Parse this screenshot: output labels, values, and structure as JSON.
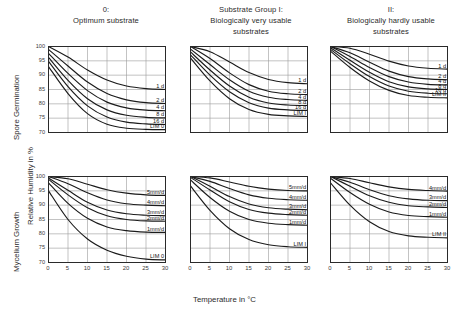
{
  "figure": {
    "axis": {
      "x_label": "Temperature in °C",
      "y_label": "Relative Humidity in %",
      "x_ticks": [
        "0",
        "5",
        "10",
        "15",
        "20",
        "25",
        "30"
      ],
      "y_ticks": [
        "100",
        "95",
        "90",
        "85",
        "80",
        "75",
        "70"
      ],
      "xlim": [
        0,
        30
      ],
      "ylim": [
        70,
        100
      ]
    },
    "row_labels": {
      "top": "Spore Germination",
      "bottom": "Mycelium Growth"
    },
    "column_titles": [
      {
        "line1": "0:",
        "line2": "Optimum substrate",
        "line3": ""
      },
      {
        "line1": "Substrate Group I:",
        "line2": "Biologically very usable",
        "line3": "substrates"
      },
      {
        "line1": "II:",
        "line2": "Biologically hardly usable",
        "line3": "substrates"
      }
    ]
  },
  "chart_data": [
    {
      "type": "line",
      "title": "0: Optimum substrate — Spore Germination",
      "panel": "top-left",
      "xlabel": "Temperature in °C",
      "ylabel": "Relative Humidity in %",
      "xlim": [
        0,
        30
      ],
      "ylim": [
        70,
        100
      ],
      "grid": true,
      "x": [
        0,
        5,
        10,
        15,
        20,
        25,
        30
      ],
      "series": [
        {
          "name": "1 d",
          "label": "1 d",
          "values": [
            100.0,
            96.3,
            91.8,
            88.3,
            86.2,
            85.3,
            85.0
          ]
        },
        {
          "name": "2 d",
          "label": "2 d",
          "values": [
            99.0,
            93.2,
            87.6,
            83.6,
            81.4,
            80.4,
            80.1
          ]
        },
        {
          "name": "4 d",
          "label": "4 d",
          "values": [
            97.6,
            90.6,
            84.6,
            80.6,
            78.6,
            77.8,
            77.6
          ]
        },
        {
          "name": "8 d",
          "label": "8 d",
          "values": [
            96.2,
            88.2,
            81.8,
            77.9,
            76.0,
            75.3,
            75.1
          ]
        },
        {
          "name": "16 d",
          "label": "16 d",
          "values": [
            94.8,
            86.0,
            79.3,
            75.4,
            73.6,
            73.0,
            72.8
          ]
        },
        {
          "name": "LIM 0",
          "label": "LIM 0",
          "values": [
            93.0,
            83.6,
            76.6,
            72.9,
            71.5,
            71.1,
            71.0
          ]
        }
      ]
    },
    {
      "type": "line",
      "title": "Substrate Group I: Biologically very usable substrates — Spore Germination",
      "panel": "top-center",
      "xlabel": "Temperature in °C",
      "ylabel": "Relative Humidity in %",
      "xlim": [
        0,
        30
      ],
      "ylim": [
        70,
        100
      ],
      "grid": true,
      "x": [
        0,
        5,
        10,
        15,
        20,
        25,
        30
      ],
      "series": [
        {
          "name": "1 d",
          "label": "1 d",
          "values": [
            100.0,
            98.2,
            94.6,
            90.9,
            88.5,
            87.4,
            87.0
          ]
        },
        {
          "name": "2 d",
          "label": "2 d",
          "values": [
            100.0,
            95.8,
            90.8,
            86.7,
            84.4,
            83.5,
            83.2
          ]
        },
        {
          "name": "4 d",
          "label": "4 d",
          "values": [
            99.1,
            93.7,
            88.4,
            84.4,
            82.3,
            81.5,
            81.2
          ]
        },
        {
          "name": "8 d",
          "label": "8 d",
          "values": [
            98.1,
            91.8,
            86.2,
            82.3,
            80.3,
            79.6,
            79.4
          ]
        },
        {
          "name": "16 d",
          "label": "16 d",
          "values": [
            97.1,
            90.0,
            84.2,
            80.4,
            78.5,
            77.9,
            77.7
          ]
        },
        {
          "name": "LIM I",
          "label": "LIM I",
          "values": [
            96.0,
            88.0,
            81.8,
            78.0,
            76.3,
            75.8,
            75.6
          ]
        }
      ]
    },
    {
      "type": "line",
      "title": "II: Biologically hardly usable substrates — Spore Germination",
      "panel": "top-right",
      "xlabel": "Temperature in °C",
      "ylabel": "Relative Humidity in %",
      "xlim": [
        0,
        30
      ],
      "ylim": [
        70,
        100
      ],
      "grid": true,
      "x": [
        0,
        5,
        10,
        15,
        20,
        25,
        30
      ],
      "series": [
        {
          "name": "1 d",
          "label": "1 d",
          "values": [
            100.0,
            99.4,
            97.3,
            94.9,
            93.2,
            92.4,
            92.1
          ]
        },
        {
          "name": "2 d",
          "label": "2 d",
          "values": [
            100.0,
            97.8,
            94.5,
            91.4,
            89.5,
            88.7,
            88.4
          ]
        },
        {
          "name": "4 d",
          "label": "4 d",
          "values": [
            100.0,
            96.5,
            92.7,
            89.5,
            87.6,
            86.8,
            86.6
          ]
        },
        {
          "name": "8 d",
          "label": "8 d",
          "values": [
            99.6,
            95.2,
            91.0,
            87.7,
            85.9,
            85.2,
            85.0
          ]
        },
        {
          "name": "16 d",
          "label": "16 d",
          "values": [
            99.0,
            94.0,
            89.5,
            86.2,
            84.4,
            83.7,
            83.5
          ]
        },
        {
          "name": "LIM II",
          "label": "LIM II",
          "values": [
            98.4,
            92.7,
            88.0,
            84.7,
            82.9,
            82.3,
            82.1
          ]
        }
      ]
    },
    {
      "type": "line",
      "title": "0: Optimum substrate — Mycelium Growth",
      "panel": "bottom-left",
      "xlabel": "Temperature in °C",
      "ylabel": "Relative Humidity in %",
      "xlim": [
        0,
        30
      ],
      "ylim": [
        70,
        100
      ],
      "grid": true,
      "x": [
        0,
        5,
        10,
        15,
        20,
        25,
        30
      ],
      "series": [
        {
          "name": "5 mm/d",
          "label": "5mm/d",
          "values": [
            100.0,
            99.2,
            97.3,
            95.4,
            94.2,
            93.6,
            93.4
          ]
        },
        {
          "name": "4 mm/d",
          "label": "4mm/d",
          "values": [
            100.0,
            97.5,
            94.3,
            91.8,
            90.5,
            90.0,
            89.8
          ]
        },
        {
          "name": "3 mm/d",
          "label": "3mm/d",
          "values": [
            99.5,
            95.2,
            91.0,
            88.3,
            87.0,
            86.5,
            86.3
          ]
        },
        {
          "name": "2 mm/d",
          "label": "2mm/d",
          "values": [
            99.0,
            93.6,
            89.1,
            86.3,
            85.0,
            84.5,
            84.4
          ]
        },
        {
          "name": "1 mm/d",
          "label": "1mm/d",
          "values": [
            97.8,
            90.6,
            85.4,
            82.4,
            81.1,
            80.6,
            80.5
          ]
        },
        {
          "name": "LIM 0",
          "label": "LIM 0",
          "values": [
            95.0,
            85.0,
            78.2,
            74.3,
            72.2,
            71.2,
            70.9
          ]
        }
      ]
    },
    {
      "type": "line",
      "title": "Substrate Group I: Biologically very usable substrates — Mycelium Growth",
      "panel": "bottom-center",
      "xlabel": "Temperature in °C",
      "ylabel": "Relative Humidity in %",
      "xlim": [
        0,
        30
      ],
      "ylim": [
        70,
        100
      ],
      "grid": true,
      "x": [
        0,
        5,
        10,
        15,
        20,
        25,
        30
      ],
      "series": [
        {
          "name": "5 mm/d",
          "label": "5mm/d",
          "values": [
            100.0,
            99.5,
            98.1,
            96.6,
            95.6,
            95.1,
            95.0
          ]
        },
        {
          "name": "4 mm/d",
          "label": "4mm/d",
          "values": [
            100.0,
            98.3,
            95.8,
            93.6,
            92.4,
            91.9,
            91.7
          ]
        },
        {
          "name": "3 mm/d",
          "label": "3mm/d",
          "values": [
            100.0,
            96.6,
            93.0,
            90.4,
            89.1,
            88.6,
            88.4
          ]
        },
        {
          "name": "2 mm/d",
          "label": "2mm/d",
          "values": [
            99.7,
            95.3,
            91.2,
            88.5,
            87.2,
            86.7,
            86.5
          ]
        },
        {
          "name": "1 mm/d",
          "label": "1mm/d",
          "values": [
            98.8,
            92.7,
            87.9,
            85.0,
            83.7,
            83.2,
            83.0
          ]
        },
        {
          "name": "LIM I",
          "label": "LIM I",
          "values": [
            96.7,
            88.2,
            81.8,
            78.0,
            76.2,
            75.5,
            75.3
          ]
        }
      ]
    },
    {
      "type": "line",
      "title": "II: Biologically hardly usable substrates — Mycelium Growth",
      "panel": "bottom-right",
      "xlabel": "Temperature in °C",
      "ylabel": "Relative Humidity in %",
      "xlim": [
        0,
        30
      ],
      "ylim": [
        70,
        100
      ],
      "grid": true,
      "x": [
        0,
        5,
        10,
        15,
        20,
        25,
        30
      ],
      "series": [
        {
          "name": "4 mm/d",
          "label": "4mm/d",
          "values": [
            100.0,
            99.3,
            97.8,
            96.4,
            95.5,
            95.1,
            94.9
          ]
        },
        {
          "name": "3 mm/d",
          "label": "3mm/d",
          "values": [
            100.0,
            98.0,
            95.4,
            93.3,
            92.2,
            91.7,
            91.6
          ]
        },
        {
          "name": "2 mm/d",
          "label": "2mm/d",
          "values": [
            100.0,
            96.6,
            93.3,
            91.0,
            89.8,
            89.4,
            89.2
          ]
        },
        {
          "name": "1 mm/d",
          "label": "1mm/d",
          "values": [
            99.4,
            94.4,
            90.3,
            87.6,
            86.4,
            86.0,
            85.8
          ]
        },
        {
          "name": "LIM II",
          "label": "LIM II",
          "values": [
            97.8,
            90.0,
            84.2,
            80.8,
            79.3,
            78.8,
            78.6
          ]
        }
      ]
    }
  ],
  "style": {
    "curve_color": "#1b1b1b",
    "grid_color": "#9a9a9a",
    "frame_color": "#2a2a2a",
    "text_color": "#2b2b2b"
  }
}
